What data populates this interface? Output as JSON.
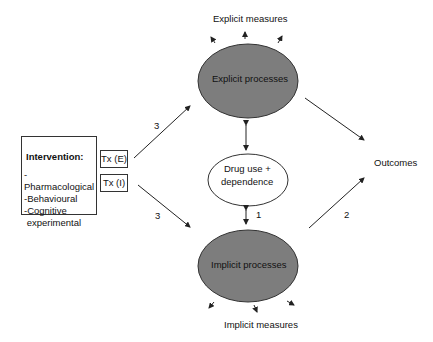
{
  "top": {
    "measures_label": "Explicit measures",
    "process_label": "Explicit processes"
  },
  "middle": {
    "label_line1": "Drug use +",
    "label_line2": "dependence"
  },
  "bottom": {
    "measures_label": "Implicit measures",
    "process_label": "Implicit processes"
  },
  "intervention": {
    "title": "Intervention:",
    "items": [
      "-Pharmacological",
      "-Behavioural",
      "-Cognitive",
      " experimental"
    ],
    "tx_explicit": "Tx (E)",
    "tx_implicit": "Tx (I)"
  },
  "outcomes_label": "Outcomes",
  "path_labels": {
    "upper_left": "3",
    "lower_left": "3",
    "center": "1",
    "lower_right": "2"
  },
  "colors": {
    "process_fill": "#7d7d7d",
    "process_stroke": "#333333",
    "line": "#222222"
  }
}
